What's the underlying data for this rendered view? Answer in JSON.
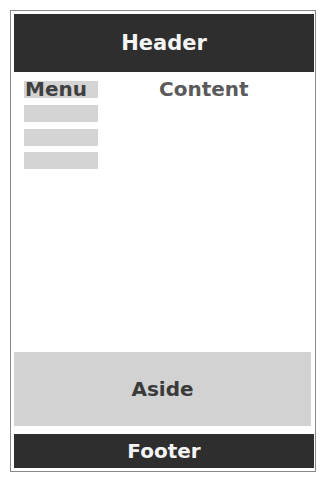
{
  "header": {
    "label": "Header"
  },
  "menu": {
    "label": "Menu",
    "item_count": 4
  },
  "content": {
    "label": "Content"
  },
  "aside": {
    "label": "Aside"
  },
  "footer": {
    "label": "Footer"
  },
  "colors": {
    "dark_bar": "#2e2e2e",
    "light_block": "#d2d2d2",
    "border": "#8a8a8a"
  }
}
